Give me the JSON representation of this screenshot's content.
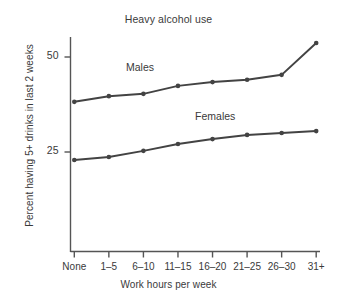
{
  "chart_data": {
    "type": "line",
    "title": "Heavy alcohol use",
    "xlabel": "Work hours per week",
    "ylabel": "Percent having 5+ drinks in last 2 weeks",
    "categories": [
      "None",
      "1–5",
      "6–10",
      "11–15",
      "16–20",
      "21–25",
      "26–30",
      "31+"
    ],
    "yticks": [
      25,
      50
    ],
    "ytick_labels": [
      "25",
      "50"
    ],
    "ylim": [
      0,
      57
    ],
    "grid": false,
    "legend": "inline-series-labels",
    "series": [
      {
        "name": "Males",
        "label_x_category": "11–15",
        "values": [
          38.2,
          39.7,
          40.3,
          42.4,
          43.4,
          44.0,
          45.3,
          53.7
        ]
      },
      {
        "name": "Females",
        "label_x_category": "21–25",
        "values": [
          22.9,
          23.7,
          25.3,
          27.1,
          28.4,
          29.5,
          30.0,
          30.5
        ]
      }
    ],
    "line_color": "#434343",
    "marker": "circle"
  },
  "axis": {
    "tick_25": "25",
    "tick_50": "50"
  },
  "labels": {
    "males": "Males",
    "females": "Females"
  }
}
